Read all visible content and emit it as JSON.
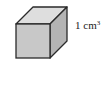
{
  "figure": {
    "shape": "cube",
    "label": {
      "value": "1 cm",
      "exponent": "3"
    },
    "colors": {
      "front": "#c8c8c8",
      "top": "#dedede",
      "side": "#b4b4b4",
      "edge": "#2a2a2a"
    }
  }
}
